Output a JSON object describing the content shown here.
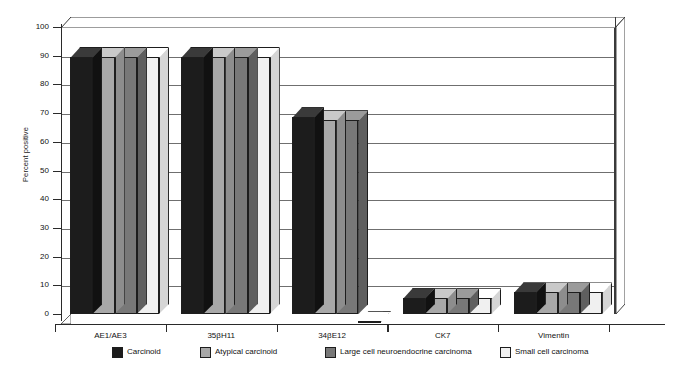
{
  "caption_remnant": "",
  "chart_data": {
    "type": "bar",
    "title": "",
    "xlabel": "",
    "ylabel": "Percent positive",
    "ylim": [
      0,
      100
    ],
    "ytick_step": 10,
    "yticks": [
      100,
      90,
      80,
      70,
      60,
      50,
      40,
      30,
      20,
      10,
      0
    ],
    "grid": true,
    "legend_position": "bottom",
    "style": "3d-clustered-column",
    "categories": [
      "AE1/AE3",
      "35βH11",
      "34βE12",
      "CK7",
      "Vimentin"
    ],
    "series": [
      {
        "name": "Carcinoid",
        "color": "#1c1c1c",
        "top_color": "#3a3a3a",
        "side_color": "#111111",
        "values": [
          93,
          93,
          72,
          9,
          11
        ]
      },
      {
        "name": "Atypical carcinoid",
        "color": "#a8a8a8",
        "top_color": "#c9c9c9",
        "side_color": "#8d8d8d",
        "values": [
          93,
          93,
          71,
          9,
          11
        ]
      },
      {
        "name": "Large cell neuroendocrine carcinoma",
        "color": "#787878",
        "top_color": "#9b9b9b",
        "side_color": "#5f5f5f",
        "values": [
          93,
          93,
          71,
          9,
          11
        ]
      },
      {
        "name": "Small cell carcinoma",
        "color": "#f0f0f0",
        "top_color": "#ffffff",
        "side_color": "#d5d5d5",
        "values": [
          93,
          93,
          1,
          9,
          11
        ]
      }
    ]
  },
  "axis": {
    "y_title": "Percent positive"
  },
  "legend": {
    "items": [
      {
        "label": "Carcinoid",
        "color": "#1c1c1c"
      },
      {
        "label": "Atypical carcinoid",
        "color": "#a8a8a8"
      },
      {
        "label": "Large cell neuroendocrine carcinoma",
        "color": "#787878"
      },
      {
        "label": "Small cell carcinoma",
        "color": "#f0f0f0"
      }
    ]
  }
}
